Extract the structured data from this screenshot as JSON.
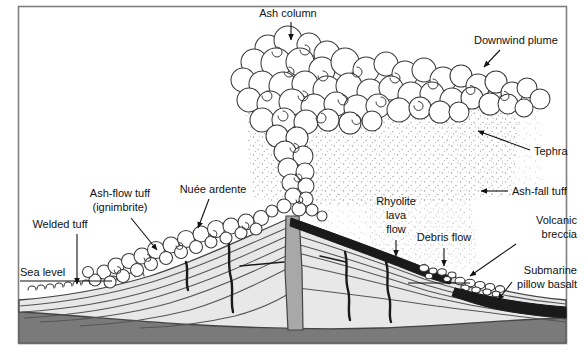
{
  "figure": {
    "type": "geological-cross-section",
    "frame": {
      "border_color": "#808080",
      "background_color": "#ffffff",
      "x": 18,
      "y": 6,
      "width": 549,
      "height": 338
    }
  },
  "palette": {
    "outline": "#111111",
    "ink": "#111111",
    "edifice_fill": "#e8e8e8",
    "edifice_stroke": "#444444",
    "basement_fill": "#7a7a7a",
    "basement_stroke": "#555555",
    "conduit_fill": "#a8a8a8",
    "lava_black": "#1a1a1a",
    "pillow_black": "#1a1a1a",
    "cloud_stroke": "#3a3a3a",
    "tephra_dot": "#9a9a9a",
    "frame_gray": "#808080"
  },
  "labels": [
    {
      "id": "ash-column",
      "text": "Ash column",
      "x": 288,
      "y": 17,
      "anchor": "middle",
      "lines": [
        "Ash column"
      ],
      "leader": {
        "type": "arrow-down",
        "x1": 291,
        "y1": 22,
        "x2": 291,
        "y2": 40
      }
    },
    {
      "id": "downwind-plume",
      "text": "Downwind plume",
      "x": 474,
      "y": 44,
      "anchor": "start",
      "lines": [
        "Downwind plume"
      ],
      "leader": {
        "type": "arrow-diagonal",
        "x1": 500,
        "y1": 50,
        "x2": 484,
        "y2": 67
      }
    },
    {
      "id": "tephra",
      "text": "Tephra",
      "x": 534,
      "y": 155,
      "anchor": "start",
      "lines": [
        "Tephra"
      ],
      "leader": {
        "type": "arrow-diagonal",
        "x1": 530,
        "y1": 150,
        "x2": 478,
        "y2": 131
      }
    },
    {
      "id": "ash-fall-tuff",
      "text": "Ash-fall tuff",
      "x": 512,
      "y": 195,
      "anchor": "start",
      "lines": [
        "Ash-fall tuff"
      ],
      "leader": {
        "type": "arrow-left",
        "x1": 508,
        "y1": 191,
        "x2": 481,
        "y2": 191
      }
    },
    {
      "id": "volcanic-breccia",
      "text": "Volcanic breccia",
      "x": 577,
      "y": 224,
      "anchor": "end",
      "lines": [
        "Volcanic",
        "breccia"
      ],
      "leader": {
        "type": "arrow-diagonal",
        "x1": 516,
        "y1": 244,
        "x2": 466,
        "y2": 277
      }
    },
    {
      "id": "submarine-pillow-basalt",
      "text": "Submarine pillow basalt",
      "x": 577,
      "y": 274,
      "anchor": "end",
      "lines": [
        "Submarine",
        "pillow basalt"
      ],
      "leader": {
        "type": "arrow-diagonal",
        "x1": 512,
        "y1": 282,
        "x2": 497,
        "y2": 300
      }
    },
    {
      "id": "rhyolite-lava-flow",
      "text": "Rhyolite lava flow",
      "x": 396,
      "y": 205,
      "anchor": "middle",
      "lines": [
        "Rhyolite",
        "lava",
        "flow"
      ],
      "leader": {
        "type": "arrow-down",
        "x1": 396,
        "y1": 238,
        "x2": 396,
        "y2": 253
      }
    },
    {
      "id": "debris-flow",
      "text": "Debris flow",
      "x": 444,
      "y": 241,
      "anchor": "middle",
      "lines": [
        "Debris flow"
      ],
      "leader": {
        "type": "arrow-down",
        "x1": 444,
        "y1": 246,
        "x2": 444,
        "y2": 265
      }
    },
    {
      "id": "nuee-ardente",
      "text": "Nuée ardente",
      "x": 213,
      "y": 193,
      "anchor": "middle",
      "lines": [
        "Nuée ardente"
      ],
      "leader": {
        "type": "arrow-down",
        "x1": 206,
        "y1": 199,
        "x2": 196,
        "y2": 227
      }
    },
    {
      "id": "ash-flow-tuff",
      "text": "Ash-flow tuff (ignimbrite)",
      "x": 120,
      "y": 197,
      "anchor": "middle",
      "lines": [
        "Ash-flow tuff",
        "(ignimbrite)"
      ],
      "leader": {
        "type": "arrow-diagonal",
        "x1": 131,
        "y1": 218,
        "x2": 156,
        "y2": 249
      }
    },
    {
      "id": "welded-tuff",
      "text": "Welded tuff",
      "x": 60,
      "y": 228,
      "anchor": "middle",
      "lines": [
        "Welded tuff"
      ],
      "leader": {
        "type": "arrow-down",
        "x1": 77,
        "y1": 233,
        "x2": 77,
        "y2": 282
      }
    },
    {
      "id": "sea-level",
      "text": "Sea level",
      "x": 20,
      "y": 272,
      "anchor": "start",
      "lines": [
        "Sea level"
      ],
      "leader": {
        "type": "line-horizontal",
        "x1": 20,
        "y1": 281,
        "x2": 112,
        "y2": 281
      }
    }
  ],
  "legend_notes": {
    "sea_level_line": "Sea level",
    "vent_label": "central conduit",
    "units": [
      "Ash column",
      "Downwind plume",
      "Tephra",
      "Ash-fall tuff",
      "Ash-flow tuff (ignimbrite)",
      "Welded tuff",
      "Nuée ardente",
      "Rhyolite lava flow",
      "Debris flow",
      "Volcanic breccia",
      "Submarine pillow basalt"
    ]
  }
}
